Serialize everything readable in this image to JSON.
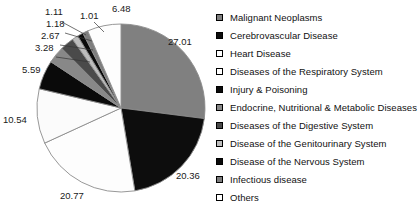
{
  "chart_data": {
    "type": "pie",
    "title": "",
    "subtitle": "",
    "xlabel": "",
    "ylabel": "",
    "legend_position": "right",
    "grid": false,
    "value_unit": "percent",
    "start_angle_deg": 0,
    "direction": "clockwise",
    "categories": [
      "Malignant Neoplasms",
      "Cerebrovascular Disease",
      "Heart Disease",
      "Diseases of the Respiratory System",
      "Injury & Poisoning",
      "Endocrine, Nutritional & Metabolic Diseases",
      "Diseases of the Digestive System",
      "Disease of the Genitourinary System",
      "Disease of the Nervous System",
      "Infectious disease",
      "Others"
    ],
    "values": [
      27.01,
      20.36,
      20.77,
      10.54,
      5.59,
      3.28,
      2.67,
      1.18,
      1.11,
      1.01,
      6.48
    ],
    "labels": [
      "27.01",
      "20.36",
      "20.77",
      "10.54",
      "5.59",
      "3.28",
      "2.67",
      "1.18",
      "1.11",
      "1.01",
      "6.48"
    ],
    "colors": [
      "#808080",
      "#0d0d0d",
      "#fdfdfd",
      "#fbfbfb",
      "#0a0a0a",
      "#888888",
      "#4a4a4a",
      "#bdbdbd",
      "#0a0a0a",
      "#7d7d7d",
      "#fdfdfd"
    ],
    "stroke_color": "#8c8c8c"
  },
  "legend": {
    "items": [
      {
        "label": "Malignant Neoplasms",
        "color": "#808080"
      },
      {
        "label": "Cerebrovascular Disease",
        "color": "#0d0d0d"
      },
      {
        "label": "Heart Disease",
        "color": "#ffffff"
      },
      {
        "label": "Diseases of the Respiratory System",
        "color": "#ffffff"
      },
      {
        "label": "Injury & Poisoning",
        "color": "#0a0a0a"
      },
      {
        "label": "Endocrine, Nutritional & Metabolic Diseases",
        "color": "#888888"
      },
      {
        "label": "Diseases of the Digestive System",
        "color": "#4a4a4a"
      },
      {
        "label": "Disease of the Genitourinary System",
        "color": "#bdbdbd"
      },
      {
        "label": "Disease of the Nervous System",
        "color": "#0a0a0a"
      },
      {
        "label": "Infectious disease",
        "color": "#7d7d7d"
      },
      {
        "label": "Others",
        "color": "#ffffff"
      }
    ]
  },
  "callouts": [
    {
      "text": "27.01",
      "x": 168,
      "y": 36
    },
    {
      "text": "20.36",
      "x": 176,
      "y": 170
    },
    {
      "text": "20.77",
      "x": 60,
      "y": 190
    },
    {
      "text": "10.54",
      "x": 3,
      "y": 114
    },
    {
      "text": "5.59",
      "x": 22,
      "y": 64
    },
    {
      "text": "3.28",
      "x": 35,
      "y": 42
    },
    {
      "text": "2.67",
      "x": 41,
      "y": 30
    },
    {
      "text": "1.18",
      "x": 46,
      "y": 18
    },
    {
      "text": "1.11",
      "x": 45,
      "y": 6
    },
    {
      "text": "1.01",
      "x": 80,
      "y": 10
    },
    {
      "text": "6.48",
      "x": 112,
      "y": 3
    }
  ]
}
